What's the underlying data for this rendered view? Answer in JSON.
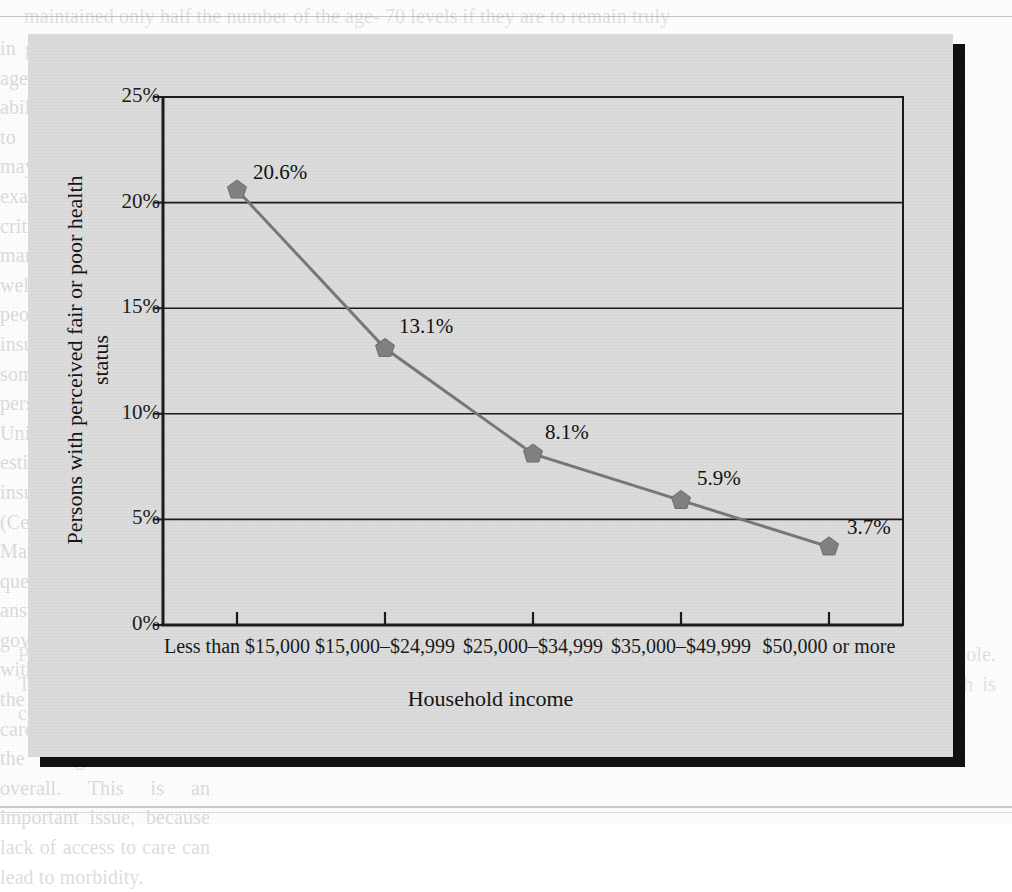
{
  "page": {
    "bleed_text_top": "maintained only half the number of the age- 70 levels if they are to remain truly",
    "bleed_text_right": "in good health after that age and to provide the ability and the motivation to remain active. This may mean periodic re-examination of goals. A critical health issue for many poor-income as well as middle-income people is access to health insurance. At present, some 44.3 million persons under 65 in the United States are estimated to lack health insurance coverage (Census Bureau 2006). Many fundamental questions must be answered by the U.S. government as it grapples with the persistence of the uninsured, access to care as a problem, and the rising cost of care overall. This is an important issue, because lack of access to care can lead to morbidity.",
    "bleed_text_bottom": "Poorer health status and lack of access to care have serious consequences for the individual and for society as a whole. They are reflected in quality-of-life assessment and in the economic burden of illness, and a decline in health is correlated with increasing age."
  },
  "figure": {
    "caption": ""
  },
  "chart_data": {
    "type": "line",
    "title": "",
    "xlabel": "Household income",
    "ylabel": "Persons with perceived fair or poor health status",
    "categories": [
      "Less than $15,000",
      "$15,000–$24,999",
      "$25,000–$34,999",
      "$35,000–$49,999",
      "$50,000 or more"
    ],
    "values": [
      20.6,
      13.1,
      8.1,
      5.9,
      3.7
    ],
    "point_labels": [
      "20.6%",
      "13.1%",
      "8.1%",
      "5.9%",
      "3.7%"
    ],
    "ylim": [
      0,
      25
    ],
    "ytick_values": [
      0,
      5,
      10,
      15,
      20,
      25
    ],
    "ytick_labels": [
      "0%",
      "5%",
      "10%",
      "15%",
      "20%",
      "25%"
    ],
    "grid": "horizontal",
    "legend": "none",
    "series_name": "Persons with perceived fair or poor health status",
    "marker": "pentagon",
    "colors": {
      "line": "#777777",
      "marker": "#808080",
      "axis": "#1b1b1b",
      "grid": "#1b1b1b",
      "panel_background": "#dcdcdc",
      "shadow": "#111111",
      "text": "#141414"
    }
  }
}
